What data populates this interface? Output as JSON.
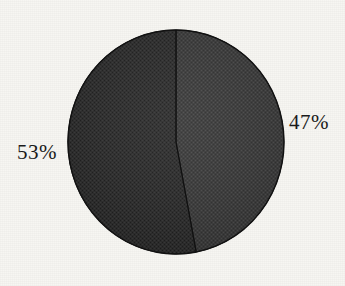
{
  "figure": {
    "background_color": "#f7f6f2",
    "width": 345,
    "height": 286
  },
  "chart_data": {
    "type": "pie",
    "title": "",
    "subtitle": "",
    "xlabel": "",
    "ylabel": "",
    "grid": false,
    "legend": "none",
    "start_angle_deg": 0,
    "direction": "clockwise",
    "labels": [
      "47%",
      "53%"
    ],
    "values": [
      47,
      53
    ],
    "value_unit": "percent",
    "total": 100,
    "slices": [
      {
        "name": "slice-47",
        "label": "47%",
        "value": 47,
        "color": "#3a3a3a",
        "position": "right",
        "label_x": 289,
        "label_y": 112
      },
      {
        "name": "slice-53",
        "label": "53%",
        "value": 53,
        "color": "#2b2b2b",
        "position": "left",
        "label_x": 17,
        "label_y": 142
      }
    ],
    "geometry": {
      "center_x": 176,
      "center_y": 142,
      "radius_x": 108,
      "radius_y": 112,
      "outline_color": "#151515"
    }
  },
  "labels": {
    "left_pct": "53%",
    "right_pct": "47%"
  }
}
